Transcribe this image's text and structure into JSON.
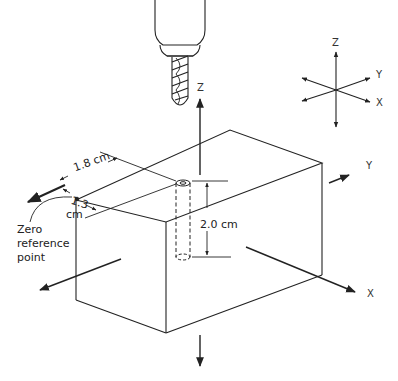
{
  "diagram": {
    "type": "isometric machining setup",
    "labels": {
      "dim_x": "1.8 cm",
      "dim_y_num": "1.3",
      "dim_y_unit": "cm",
      "depth": "2.0 cm",
      "zero_ref_line1": "Zero",
      "zero_ref_line2": "reference",
      "zero_ref_line3": "point",
      "block_axis_z": "Z",
      "block_axis_y": "Y",
      "block_axis_x": "X",
      "legend_axis_z": "Z",
      "legend_axis_y": "Y",
      "legend_axis_x": "X"
    },
    "colors": {
      "line": "#222222",
      "background": "#ffffff"
    }
  }
}
